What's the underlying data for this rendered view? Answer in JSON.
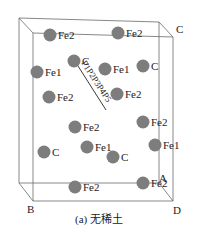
{
  "figure": {
    "caption": "(a) 无稀土",
    "corner_labels": {
      "C": "C",
      "A": "A",
      "B": "B",
      "D": "D"
    },
    "path_label": "P1P2P3P4P5",
    "atoms": [
      {
        "label": "Fe2",
        "x": 50,
        "y": 35
      },
      {
        "label": "Fe2",
        "x": 118,
        "y": 33
      },
      {
        "label": "C",
        "x": 74,
        "y": 61
      },
      {
        "label": "Fe1",
        "x": 37,
        "y": 72
      },
      {
        "label": "Fe1",
        "x": 105,
        "y": 69
      },
      {
        "label": "C",
        "x": 143,
        "y": 66
      },
      {
        "label": "Fe2",
        "x": 49,
        "y": 97
      },
      {
        "label": "Fe2",
        "x": 117,
        "y": 94
      },
      {
        "label": "Fe2",
        "x": 75,
        "y": 127
      },
      {
        "label": "Fe2",
        "x": 143,
        "y": 122
      },
      {
        "label": "C",
        "x": 44,
        "y": 152
      },
      {
        "label": "Fe1",
        "x": 87,
        "y": 147
      },
      {
        "label": "C",
        "x": 113,
        "y": 157
      },
      {
        "label": "Fe1",
        "x": 155,
        "y": 145
      },
      {
        "label": "Fe2",
        "x": 75,
        "y": 187
      },
      {
        "label": "Fe2",
        "x": 143,
        "y": 183
      }
    ]
  }
}
